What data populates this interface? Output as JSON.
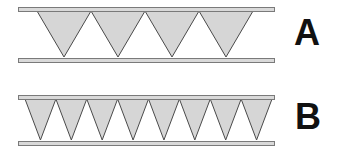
{
  "diagrams": [
    {
      "label": "A",
      "bar_left": 18,
      "bar_right": 274,
      "top_bar": {
        "y": 7,
        "height": 4
      },
      "bottom_bar": {
        "y": 58,
        "height": 4
      },
      "triangle_count": 4,
      "triangles_x_start": 37,
      "triangles_x_end": 253,
      "apex_y": 57
    },
    {
      "label": "B",
      "bar_left": 18,
      "bar_right": 274,
      "top_bar": {
        "y": 95,
        "height": 4
      },
      "bottom_bar": {
        "y": 141,
        "height": 4
      },
      "triangle_count": 8,
      "triangles_x_start": 25,
      "triangles_x_end": 272,
      "apex_y": 140
    }
  ],
  "colors": {
    "bar_fill": "#d9d9d9",
    "bar_stroke": "#7a7a7a",
    "triangle_fill": "#d6d6d6",
    "triangle_stroke": "#4a4a4a",
    "label": "#111111"
  }
}
